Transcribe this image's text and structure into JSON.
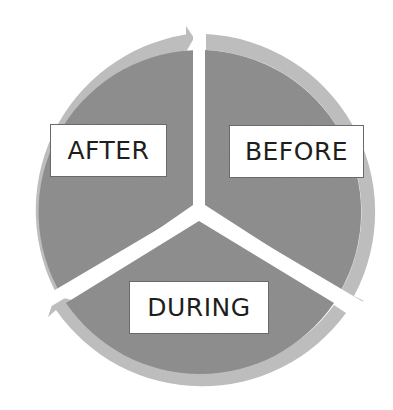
{
  "diagram": {
    "type": "cycle",
    "direction": "clockwise",
    "stages": [
      {
        "id": "before",
        "label": "BEFORE",
        "position": "upper-right"
      },
      {
        "id": "during",
        "label": "DURING",
        "position": "bottom"
      },
      {
        "id": "after",
        "label": "AFTER",
        "position": "upper-left"
      }
    ],
    "flow": [
      "BEFORE",
      "DURING",
      "AFTER",
      "BEFORE"
    ]
  },
  "colors": {
    "segment_fill": "#8a8a8a",
    "arrow_ring": "#bdbdbd",
    "label_background": "#ffffff",
    "label_text": "#1e1e1e",
    "background": "#ffffff"
  }
}
